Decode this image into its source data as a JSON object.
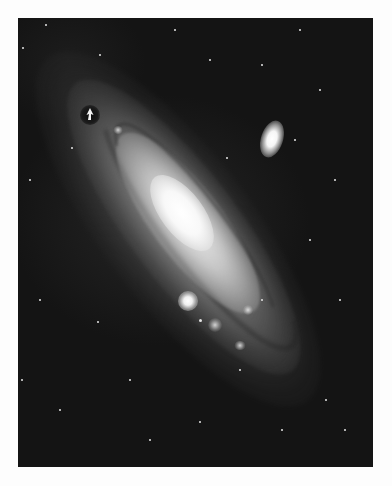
{
  "image": {
    "subject": "Andromeda Galaxy (M31) spiral galaxy photograph",
    "style": "black-and-white astronomical photograph on white page",
    "frame": {
      "left": 18,
      "top": 18,
      "width": 355,
      "height": 449
    },
    "colors": {
      "page_background": "#fdfdfd",
      "sky": "#141414",
      "core": "#ffffff",
      "arm": "#bebebe",
      "dust": "#1e1e1e"
    },
    "features": {
      "main_galaxy": {
        "label": "M31 spiral disk",
        "orientation_deg": 53
      },
      "companion_upper_right": {
        "label": "M110 elliptical companion",
        "x": 254,
        "y": 121
      },
      "companion_lower_left": {
        "label": "M32 compact companion",
        "x": 170,
        "y": 283
      },
      "marker": {
        "label": "arrow marker",
        "x": 72,
        "y": 97
      }
    },
    "stars": [
      {
        "x": 46,
        "y": 25,
        "r": 1.4
      },
      {
        "x": 23,
        "y": 48,
        "r": 1.2
      },
      {
        "x": 100,
        "y": 55,
        "r": 1.0
      },
      {
        "x": 72,
        "y": 148,
        "r": 1.2
      },
      {
        "x": 30,
        "y": 180,
        "r": 1.0
      },
      {
        "x": 40,
        "y": 300,
        "r": 1.3
      },
      {
        "x": 98,
        "y": 322,
        "r": 1.1
      },
      {
        "x": 130,
        "y": 380,
        "r": 1.0
      },
      {
        "x": 60,
        "y": 410,
        "r": 1.2
      },
      {
        "x": 200,
        "y": 422,
        "r": 1.0
      },
      {
        "x": 300,
        "y": 30,
        "r": 1.1
      },
      {
        "x": 320,
        "y": 90,
        "r": 1.0
      },
      {
        "x": 335,
        "y": 180,
        "r": 1.2
      },
      {
        "x": 310,
        "y": 240,
        "r": 1.0
      },
      {
        "x": 340,
        "y": 300,
        "r": 1.3
      },
      {
        "x": 210,
        "y": 60,
        "r": 1.0
      },
      {
        "x": 175,
        "y": 30,
        "r": 1.0
      },
      {
        "x": 262,
        "y": 65,
        "r": 1.1
      },
      {
        "x": 227,
        "y": 158,
        "r": 1.0
      },
      {
        "x": 295,
        "y": 140,
        "r": 1.0
      },
      {
        "x": 282,
        "y": 430,
        "r": 1.2
      },
      {
        "x": 326,
        "y": 400,
        "r": 1.0
      },
      {
        "x": 345,
        "y": 430,
        "r": 1.1
      },
      {
        "x": 150,
        "y": 440,
        "r": 1.0
      },
      {
        "x": 22,
        "y": 380,
        "r": 1.0
      },
      {
        "x": 200,
        "y": 320,
        "r": 1.5
      },
      {
        "x": 240,
        "y": 370,
        "r": 1.0
      },
      {
        "x": 262,
        "y": 300,
        "r": 1.0
      }
    ],
    "star_clouds": [
      {
        "x": 215,
        "y": 325,
        "w": 14,
        "h": 14
      },
      {
        "x": 248,
        "y": 310,
        "w": 10,
        "h": 10
      },
      {
        "x": 240,
        "y": 345,
        "w": 12,
        "h": 9
      },
      {
        "x": 118,
        "y": 130,
        "w": 10,
        "h": 8
      },
      {
        "x": 96,
        "y": 115,
        "w": 8,
        "h": 8
      }
    ]
  }
}
